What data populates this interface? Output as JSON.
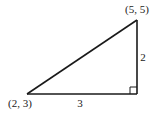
{
  "diagram": {
    "type": "right-triangle",
    "vertices": {
      "top": {
        "label": "(5, 5)",
        "x": 5,
        "y": 5
      },
      "bottom_left": {
        "label": "(2, 3)",
        "x": 2,
        "y": 3
      }
    },
    "sides": {
      "horizontal": {
        "label": "3"
      },
      "vertical": {
        "label": "2"
      }
    },
    "right_angle_marker": true,
    "stroke_color": "#1a1a1a"
  }
}
